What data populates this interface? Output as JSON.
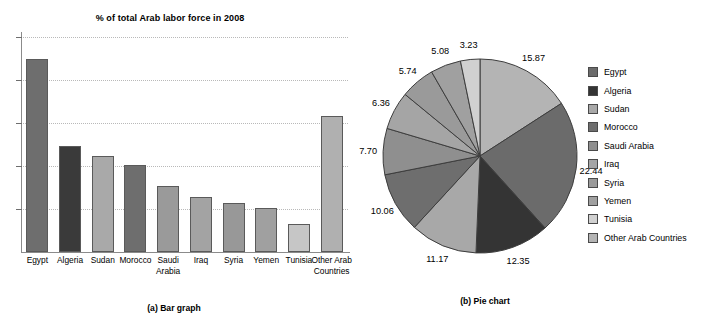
{
  "chart_data": [
    {
      "type": "bar",
      "panel_label": "(a) Bar graph",
      "title": "% of total Arab labor force in 2008",
      "xlabel": "",
      "ylabel": "",
      "ylim": [
        0,
        25
      ],
      "grid": true,
      "gridlines": [
        5,
        10,
        15,
        20,
        25
      ],
      "axis_tick_labels_shown": false,
      "categories": [
        "Egypt",
        "Algeria",
        "Sudan",
        "Morocco",
        "Saudi Arabia",
        "Iraq",
        "Syria",
        "Yemen",
        "Tunisia",
        "Other Arab Countries"
      ],
      "values": [
        22.44,
        12.35,
        11.17,
        10.06,
        7.7,
        6.36,
        5.74,
        5.08,
        3.23,
        15.87
      ],
      "bar_colors": [
        "#6e6e6e",
        "#3a3a3a",
        "#a9a9a9",
        "#6e6e6e",
        "#9a9a9a",
        "#a3a3a3",
        "#989898",
        "#a0a0a0",
        "#c6c6c6",
        "#b0b0b0"
      ]
    },
    {
      "type": "pie",
      "panel_label": "(b) Pie chart",
      "title": "",
      "start_angle_deg": 0,
      "direction": "clockwise",
      "legend_position": "right",
      "labels": [
        "Egypt",
        "Algeria",
        "Sudan",
        "Morocco",
        "Saudi Arabia",
        "Iraq",
        "Syria",
        "Yemen",
        "Tunisia",
        "Other Arab Countries"
      ],
      "values": [
        22.44,
        12.35,
        11.17,
        10.06,
        7.7,
        6.36,
        5.74,
        5.08,
        3.23,
        15.87
      ],
      "value_labels": [
        "22.44",
        "12.35",
        "11.17",
        "10.06",
        "7.70",
        "6.36",
        "5.74",
        "5.08",
        "3.23",
        "15.87"
      ],
      "slice_order_clockwise_from_12": [
        "Other Arab Countries",
        "Egypt",
        "Algeria",
        "Sudan",
        "Morocco",
        "Saudi Arabia",
        "Iraq",
        "Syria",
        "Yemen",
        "Tunisia"
      ],
      "colors": {
        "Egypt": "#6b6b6b",
        "Algeria": "#343434",
        "Sudan": "#a8a8a8",
        "Morocco": "#6e6e6e",
        "Saudi Arabia": "#8f8f8f",
        "Iraq": "#a5a5a5",
        "Syria": "#9a9a9a",
        "Yemen": "#a0a0a0",
        "Tunisia": "#d0d0d0",
        "Other Arab Countries": "#b4b4b4"
      }
    }
  ],
  "bar": {
    "title": "% of total Arab labor force in 2008",
    "caption": "(a) Bar graph",
    "categories": [
      "Egypt",
      "Algeria",
      "Sudan",
      "Morocco",
      "Saudi Arabia",
      "Iraq",
      "Syria",
      "Yemen",
      "Tunisia",
      "Other Arab Countries"
    ]
  },
  "pie": {
    "caption": "(b) Pie chart",
    "legend": [
      {
        "label": "Egypt",
        "color": "#6b6b6b"
      },
      {
        "label": "Algeria",
        "color": "#343434"
      },
      {
        "label": "Sudan",
        "color": "#a8a8a8"
      },
      {
        "label": "Morocco",
        "color": "#6e6e6e"
      },
      {
        "label": "Saudi Arabia",
        "color": "#8f8f8f"
      },
      {
        "label": "Iraq",
        "color": "#a5a5a5"
      },
      {
        "label": "Syria",
        "color": "#9a9a9a"
      },
      {
        "label": "Yemen",
        "color": "#a0a0a0"
      },
      {
        "label": "Tunisia",
        "color": "#d0d0d0"
      },
      {
        "label": "Other Arab Countries",
        "color": "#b4b4b4"
      }
    ],
    "value_labels": {
      "other_arab_countries": "15.87",
      "egypt": "22.44",
      "algeria": "12.35",
      "sudan": "11.17",
      "morocco": "10.06",
      "saudi_arabia": "7.70",
      "iraq": "6.36",
      "syria": "5.74",
      "yemen": "5.08",
      "tunisia": "3.23"
    }
  }
}
